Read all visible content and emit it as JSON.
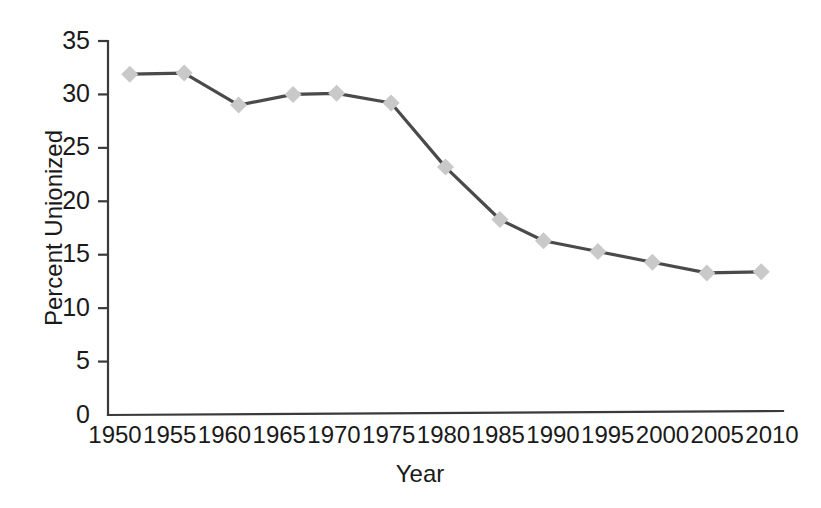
{
  "chart_data": {
    "type": "line",
    "title": "",
    "xlabel": "Year",
    "ylabel": "Percent Unionized",
    "xlim": [
      1950,
      2012
    ],
    "ylim": [
      0,
      35
    ],
    "grid": false,
    "legend": null,
    "x_tick_labels": [
      "1950",
      "1955",
      "1960",
      "1965",
      "1970",
      "1975",
      "1980",
      "1985",
      "1990",
      "1995",
      "2000",
      "2005",
      "2010"
    ],
    "y_tick_labels": [
      "0",
      "5",
      "10",
      "15",
      "20",
      "25",
      "30",
      "35"
    ],
    "y_ticks": [
      0,
      5,
      10,
      15,
      20,
      25,
      30,
      35
    ],
    "x_ticks": [
      1950,
      1955,
      1960,
      1965,
      1970,
      1975,
      1980,
      1985,
      1990,
      1995,
      2000,
      2005,
      2010
    ],
    "series": [
      {
        "name": "Percent Unionized",
        "marker": "diamond",
        "marker_color": "#c9c9c9",
        "line_color": "#4a4a4a",
        "x": [
          1952,
          1957,
          1962,
          1967,
          1971,
          1976,
          1981,
          1986,
          1990,
          1995,
          2000,
          2005,
          2010
        ],
        "values": [
          31.9,
          32.0,
          29.0,
          30.0,
          30.1,
          29.2,
          23.2,
          18.3,
          16.3,
          15.3,
          14.3,
          13.3,
          13.4
        ]
      }
    ]
  },
  "axes": {
    "y_axis_title": "Percent Unionized",
    "x_axis_title": "Year"
  },
  "colors": {
    "line": "#4a4a4a",
    "marker": "#c9c9c9",
    "axis": "#3a3a3a",
    "text": "#1a1a1a",
    "background": "#ffffff"
  }
}
